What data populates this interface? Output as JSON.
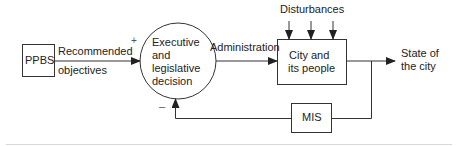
{
  "diagram": {
    "nodes": {
      "ppbs": {
        "label": "PPBS"
      },
      "decision": {
        "line1": "Executive",
        "line2": "and",
        "line3": "legislative",
        "line4": "decision"
      },
      "city": {
        "line1": "City and",
        "line2": "its people"
      },
      "mis": {
        "label": "MIS"
      }
    },
    "edges": {
      "recommended": {
        "line1": "Recommended",
        "line2": "objectives"
      },
      "administration": {
        "label": "Administration"
      },
      "disturbances": {
        "label": "Disturbances"
      },
      "output": {
        "line1": "State of",
        "line2": "the city"
      }
    },
    "signs": {
      "plus": "+",
      "minus": "–"
    },
    "colors": {
      "stroke": "#333333",
      "background": "#ffffff",
      "rule": "#d8d8d8"
    }
  }
}
